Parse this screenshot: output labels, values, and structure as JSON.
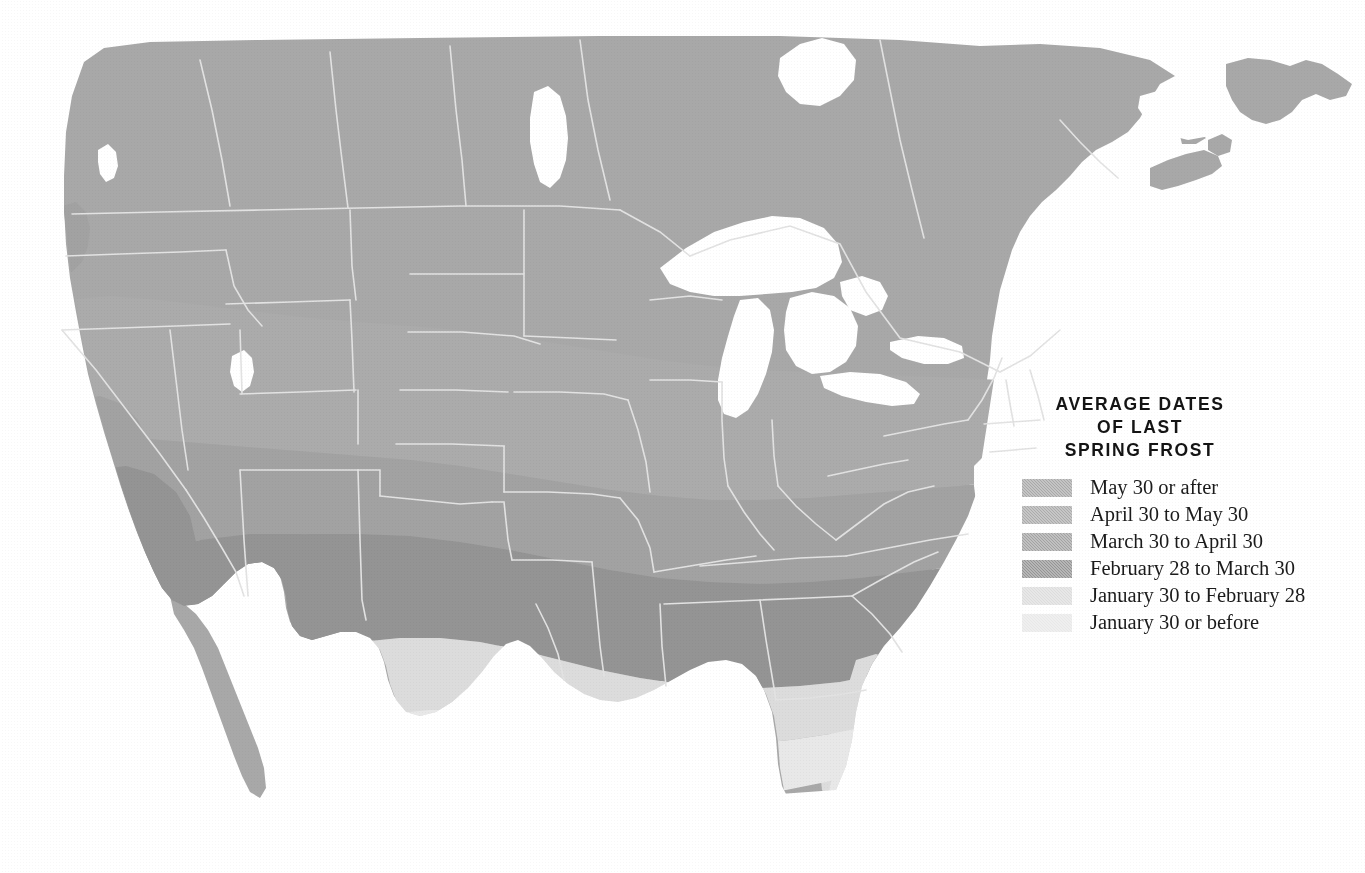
{
  "page": {
    "width": 1365,
    "height": 873,
    "background": "#ffffff"
  },
  "legend": {
    "title_lines": [
      "Average Dates",
      "of Last",
      "Spring Frost"
    ],
    "title_full": "Average Dates of Last Spring Frost",
    "entries": [
      {
        "label": "May 30 or after",
        "color": "#a8a8a8",
        "zone": "z1"
      },
      {
        "label": "April 30 to May 30",
        "color": "#ababab",
        "zone": "z2"
      },
      {
        "label": "March 30 to April 30",
        "color": "#a2a2a2",
        "zone": "z3"
      },
      {
        "label": "February 28 to March 30",
        "color": "#949494",
        "zone": "z4"
      },
      {
        "label": "January 30 to February 28",
        "color": "#dcdcdc",
        "zone": "z5"
      },
      {
        "label": "January 30 or before",
        "color": "#e8e8e8",
        "zone": "z6"
      }
    ]
  },
  "map_data": {
    "type": "choropleth",
    "title": "Average Dates of Last Spring Frost",
    "region": "United States (contiguous) with southern Canada and northern Mexico",
    "projection": "conic",
    "water_color": "#ffffff",
    "border_color": "#e0e0e0",
    "texture": "halftone-dither",
    "zone_colors": {
      "z1": "#a8a8a8",
      "z2": "#ababab",
      "z3": "#a2a2a2",
      "z4": "#949494",
      "z5": "#dcdcdc",
      "z6": "#e8e8e8"
    },
    "water_bodies": [
      "Lake Superior",
      "Lake Michigan",
      "Lake Huron",
      "Lake Erie",
      "Lake Ontario",
      "Great Salt Lake",
      "Lake Winnipeg",
      "Gulf of Mexico",
      "Atlantic Ocean",
      "Pacific Ocean",
      "Chesapeake Bay",
      "Puget Sound",
      "San Francisco Bay"
    ],
    "landmasses": [
      "Contiguous United States",
      "Southern Canada",
      "Vancouver Island",
      "Nova Scotia",
      "Newfoundland",
      "Northern Mexico",
      "Baja California",
      "Florida Peninsula"
    ]
  }
}
